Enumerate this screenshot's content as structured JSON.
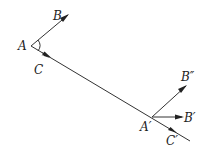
{
  "diagram": {
    "labels": {
      "A": "A",
      "B": "B",
      "C": "C",
      "A_prime": "A′",
      "B_prime": "B′",
      "B_double_prime": "B″",
      "C_prime": "C′"
    },
    "colors": {
      "stroke": "#333333",
      "background": "#ffffff"
    }
  }
}
